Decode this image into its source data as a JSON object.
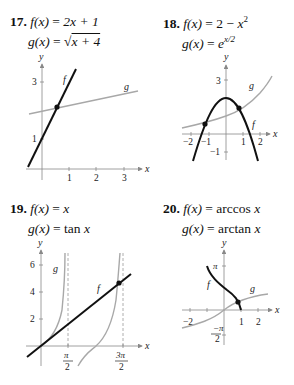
{
  "problems": [
    {
      "number": "17.",
      "f_label": "f(x) = 2x + 1",
      "f_lhs": "f(x)",
      "f_rhs": "2x + 1",
      "g_lhs": "g(x)",
      "g_rhs": "√x + 4",
      "g_rhs_radicand": "x + 4",
      "graph": {
        "x_axis_label": "x",
        "y_axis_label": "y",
        "x_ticks": [
          "1",
          "2",
          "3"
        ],
        "y_ticks": [
          "1",
          "3"
        ],
        "curve_labels": {
          "f": "f",
          "g": "g"
        }
      }
    },
    {
      "number": "18.",
      "f_lhs": "f(x)",
      "f_rhs": "2 − x²",
      "g_lhs": "g(x)",
      "g_rhs": "e^{x/2}",
      "graph": {
        "x_axis_label": "x",
        "y_axis_label": "y",
        "x_ticks": [
          "−2",
          "−1",
          "1",
          "2"
        ],
        "y_ticks": [
          "3",
          "−1"
        ],
        "curve_labels": {
          "f": "f",
          "g": "g"
        }
      }
    },
    {
      "number": "19.",
      "f_lhs": "f(x)",
      "f_rhs": "x",
      "g_lhs": "g(x)",
      "g_rhs": "tan x",
      "graph": {
        "x_axis_label": "x",
        "y_axis_label": "y",
        "x_ticks": [
          "π/2",
          "3π/2"
        ],
        "y_ticks": [
          "2",
          "4",
          "6"
        ],
        "curve_labels": {
          "f": "f",
          "g": "g"
        }
      }
    },
    {
      "number": "20.",
      "f_lhs": "f(x)",
      "f_rhs": "arccos x",
      "g_lhs": "g(x)",
      "g_rhs": "arctan x",
      "graph": {
        "x_axis_label": "x",
        "y_axis_label": "y",
        "x_ticks": [
          "−2",
          "1",
          "2"
        ],
        "y_ticks": [
          "π",
          "−π/2"
        ],
        "curve_labels": {
          "f": "f",
          "g": "g"
        }
      }
    }
  ],
  "colors": {
    "f_curve": "#111111",
    "g_curve": "#a8a8a8",
    "axis": "#888888"
  }
}
